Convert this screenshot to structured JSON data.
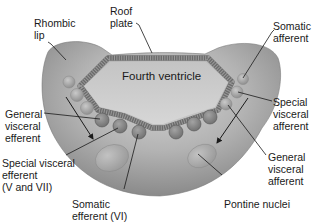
{
  "diagram": {
    "colors": {
      "background": "#ffffff",
      "tissue_fill": "#a9a9a9",
      "tissue_dark": "#8c8c8c",
      "ventricle_fill": "#c8c8c8",
      "roof_plate": "#6e6e6e",
      "nucleus_fill": "#b5b5b5",
      "nucleus_dark": "#8f8f8f",
      "label_text": "#1a1a1a"
    },
    "ventricle_label": "Fourth ventricle",
    "labels": {
      "rhombic_lip": "Rhombic\nlip",
      "roof_plate": "Roof\nplate",
      "somatic_afferent": "Somatic\nafferent",
      "special_visceral_afferent": "Special\nvisceral\nafferent",
      "general_visceral_afferent": "General\nvisceral\nafferent",
      "pontine_nuclei": "Pontine nuclei",
      "somatic_efferent": "Somatic\nefferent (VI)",
      "special_visceral_efferent": "Special visceral\nefferent\n(V and VII)",
      "general_visceral_efferent": "General\nvisceral\nefferent"
    }
  }
}
